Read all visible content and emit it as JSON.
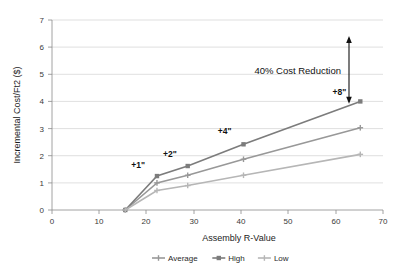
{
  "chart_data": {
    "type": "line",
    "title": "",
    "xlabel": "Assembly R-Value",
    "ylabel": "Incremental Cost/Ft2 ($)",
    "xlim": [
      0,
      70
    ],
    "ylim": [
      0,
      7
    ],
    "xticks": [
      "0",
      "10",
      "20",
      "30",
      "40",
      "50",
      "60",
      "70"
    ],
    "yticks": [
      "0",
      "1",
      "2",
      "3",
      "4",
      "5",
      "6",
      "7"
    ],
    "grid": true,
    "legend_position": "bottom",
    "x": [
      15.5,
      22.2,
      28.7,
      40.5,
      65.2
    ],
    "point_labels": [
      "",
      "+1\"",
      "+2\"",
      "+4\"",
      "+8\""
    ],
    "series": [
      {
        "name": "Average",
        "color": "#989898",
        "marker": "plus",
        "values": [
          0,
          1.0,
          1.28,
          1.87,
          3.03
        ]
      },
      {
        "name": "High",
        "color": "#7c7c7c",
        "marker": "square",
        "values": [
          0,
          1.25,
          1.62,
          2.42,
          4.0
        ]
      },
      {
        "name": "Low",
        "color": "#b6b6b6",
        "marker": "plus",
        "values": [
          0,
          0.72,
          0.9,
          1.28,
          2.05
        ]
      }
    ],
    "annotations": [
      {
        "text": "40% Cost Reduction",
        "x": 65.2,
        "y_from": 4.0,
        "y_to": 6.45,
        "arrow": "double"
      }
    ]
  },
  "legend": {
    "items": [
      {
        "label": "Average"
      },
      {
        "label": "High"
      },
      {
        "label": "Low"
      }
    ]
  }
}
